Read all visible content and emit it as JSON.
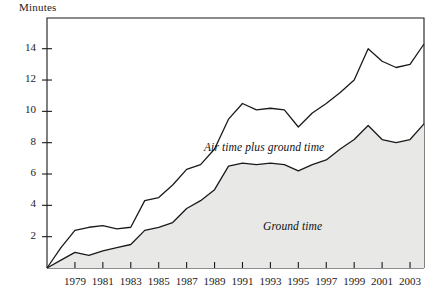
{
  "chart_data": {
    "type": "area",
    "title": "",
    "ylabel": "Minutes",
    "xlabel": "",
    "ylim": [
      0,
      15.5
    ],
    "xlim": [
      1977,
      2004
    ],
    "grid": false,
    "legend_position": "inline-annotation",
    "stacked": true,
    "y_ticks": [
      2,
      4,
      6,
      8,
      10,
      12,
      14
    ],
    "x_ticks": [
      1979,
      1981,
      1983,
      1985,
      1987,
      1989,
      1991,
      1993,
      1995,
      1997,
      1999,
      2001,
      2003
    ],
    "x": [
      1977,
      1978,
      1979,
      1980,
      1981,
      1982,
      1983,
      1984,
      1985,
      1986,
      1987,
      1988,
      1989,
      1990,
      1991,
      1992,
      1993,
      1994,
      1995,
      1996,
      1997,
      1998,
      1999,
      2000,
      2001,
      2002,
      2003,
      2004
    ],
    "series": [
      {
        "name": "Ground time",
        "fill_color": "#e8e8e6",
        "line_color": "#1a1a1a",
        "values": [
          0.0,
          0.5,
          1.0,
          0.8,
          1.1,
          1.3,
          1.5,
          2.4,
          2.6,
          2.9,
          3.8,
          4.3,
          5.0,
          6.5,
          6.7,
          6.6,
          6.7,
          6.6,
          6.2,
          6.6,
          6.9,
          7.6,
          8.2,
          9.1,
          8.2,
          8.0,
          8.2,
          9.2
        ]
      },
      {
        "name": "Air time plus ground time",
        "fill_color": "none",
        "line_color": "#1a1a1a",
        "values": [
          0.0,
          1.3,
          2.4,
          2.6,
          2.7,
          2.5,
          2.6,
          4.3,
          4.5,
          5.3,
          6.3,
          6.6,
          7.6,
          9.5,
          10.5,
          10.1,
          10.2,
          10.1,
          9.0,
          9.9,
          10.5,
          11.2,
          12.0,
          14.0,
          13.2,
          12.8,
          13.0,
          14.3
        ]
      }
    ],
    "annotations": [
      {
        "text": "Air time plus ground time",
        "x_px": 204,
        "y_px": 141
      },
      {
        "text": "Ground time",
        "x_px": 263,
        "y_px": 220
      }
    ]
  },
  "geometry": {
    "plot_left": 47,
    "plot_right": 424,
    "plot_top": 18,
    "plot_bottom": 268,
    "x_start_year": 1977,
    "x_end_year": 2004,
    "y_min": 0,
    "y_max": 15.96
  }
}
